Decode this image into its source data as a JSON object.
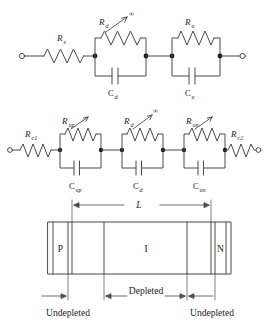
{
  "figure": {
    "stroke_color": "#4a4a4a",
    "text_color": "#1a1a1a"
  },
  "circuit_top": {
    "name": "two-section-equivalent-circuit",
    "series_resistor": {
      "label": "R",
      "subscript": "s"
    },
    "branches": [
      {
        "resistor": {
          "label": "R",
          "subscript": "d",
          "annotation": "∞",
          "variable": true
        },
        "capacitor": {
          "label": "C",
          "subscript": "d"
        }
      },
      {
        "resistor": {
          "label": "R",
          "subscript": "u",
          "annotation": "",
          "variable": false
        },
        "capacitor": {
          "label": "C",
          "subscript": "u"
        }
      }
    ]
  },
  "circuit_bottom": {
    "name": "five-element-equivalent-circuit",
    "left_contact_resistor": {
      "label": "R",
      "subscript": "c1"
    },
    "right_contact_resistor": {
      "label": "R",
      "subscript": "c2"
    },
    "branches": [
      {
        "resistor": {
          "label": "R",
          "subscript": "up",
          "annotation": "",
          "variable": true
        },
        "capacitor": {
          "label": "C",
          "subscript": "up"
        }
      },
      {
        "resistor": {
          "label": "R",
          "subscript": "d",
          "annotation": "∞",
          "variable": true
        },
        "capacitor": {
          "label": "C",
          "subscript": "d"
        }
      },
      {
        "resistor": {
          "label": "R",
          "subscript": "un",
          "annotation": "",
          "variable": true
        },
        "capacitor": {
          "label": "C",
          "subscript": "un"
        }
      }
    ]
  },
  "device": {
    "name": "pin-diode-cross-section",
    "regions": [
      {
        "id": "p-region",
        "label": "P"
      },
      {
        "id": "i-region",
        "label": "I"
      },
      {
        "id": "n-region",
        "label": "N"
      }
    ],
    "dimensions": {
      "total_length": "L",
      "depleted": "Depleted",
      "undepleted_left": "Undepleted",
      "undepleted_right": "Undepleted"
    }
  }
}
